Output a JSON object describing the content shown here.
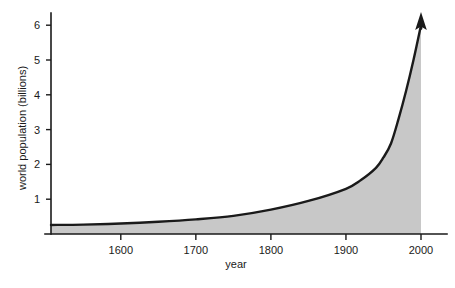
{
  "chart_data": {
    "type": "area",
    "title": "",
    "subtitle": "",
    "xlabel": "year",
    "ylabel": "world population (billions)",
    "xlim": [
      1507,
      2012
    ],
    "ylim": [
      0,
      6.35
    ],
    "grid": false,
    "legend": null,
    "annotations": [
      {
        "name": "growth-arrow",
        "description": "upward arrowhead at end of curve indicating continued growth",
        "x": 2000,
        "y": 6.35
      }
    ],
    "xticks": [
      1600,
      1700,
      1800,
      1900,
      2000
    ],
    "xtick_labels": [
      "1600",
      "1700",
      "1800",
      "1900",
      "2000"
    ],
    "yticks": [
      1,
      2,
      3,
      4,
      5,
      6
    ],
    "ytick_labels": [
      "1",
      "2",
      "3",
      "4",
      "5",
      "6"
    ],
    "series": [
      {
        "name": "world population",
        "fill_color": "#c8c8c8",
        "line_color": "#1a1a1a",
        "x": [
          1507,
          1550,
          1600,
          1650,
          1700,
          1750,
          1800,
          1850,
          1900,
          1920,
          1940,
          1950,
          1960,
          1970,
          1980,
          1990,
          2000
        ],
        "values": [
          0.26,
          0.27,
          0.3,
          0.35,
          0.42,
          0.52,
          0.7,
          0.95,
          1.3,
          1.55,
          1.9,
          2.2,
          2.6,
          3.3,
          4.1,
          5.0,
          6.0
        ]
      }
    ]
  },
  "axis": {
    "y_title": "world population (billions)",
    "x_title": "year",
    "y_labels": [
      "6",
      "5",
      "4",
      "3",
      "2",
      "1"
    ],
    "x_labels": [
      "1600",
      "1700",
      "1800",
      "1900",
      "2000"
    ]
  },
  "colors": {
    "background": "#ffffff",
    "ink": "#1a1a1a",
    "area": "#c8c8c8"
  }
}
